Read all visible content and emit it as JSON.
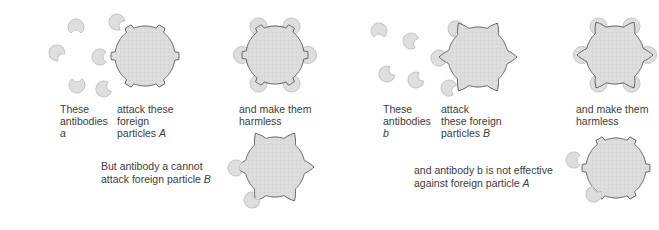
{
  "colors": {
    "background": "#ffffff",
    "particle_fill": "#dcdcdc",
    "particle_stroke": "#555555",
    "antibody_fill": "#dedede",
    "antibody_stroke": "#c4c4c4",
    "text": "#3c3c3c"
  },
  "panels": {
    "left": {
      "antibody_label": [
        "These",
        "antibodies"
      ],
      "antibody_symbol": "a",
      "attack_label": [
        "attack these",
        "foreign",
        "particles"
      ],
      "attack_symbol": "A",
      "result_label": [
        "and make them",
        "harmless"
      ],
      "note": [
        "But antibody a cannot",
        "attack foreign particle"
      ],
      "note_symbol": "B",
      "free_antibodies": [
        {
          "x": 76,
          "y": 27,
          "rot": 90
        },
        {
          "x": 117,
          "y": 22,
          "rot": 30
        },
        {
          "x": 57,
          "y": 53,
          "rot": 45
        },
        {
          "x": 100,
          "y": 57,
          "rot": 0
        },
        {
          "x": 77,
          "y": 85,
          "rot": -90
        },
        {
          "x": 104,
          "y": 89,
          "rot": -20
        }
      ],
      "target_particle": {
        "type": "A",
        "x": 145,
        "y": 56,
        "r": 30
      },
      "bound_particle": {
        "type": "A",
        "x": 275,
        "y": 55,
        "r": 29
      },
      "nontarget_particle": {
        "type": "B",
        "x": 275,
        "y": 167,
        "r": 30
      },
      "nontarget_antibodies": [
        {
          "x": 236,
          "y": 168,
          "rot": 0
        },
        {
          "x": 252,
          "y": 200,
          "rot": -45
        }
      ]
    },
    "right": {
      "antibody_label": [
        "These",
        "antibodies"
      ],
      "antibody_symbol": "b",
      "attack_label": [
        "attack",
        "these foreign",
        "particles"
      ],
      "attack_symbol": "B",
      "result_label": [
        "and make them",
        "harmless"
      ],
      "note": [
        "and antibody b is not effective",
        "against foreign particle"
      ],
      "note_symbol": "A",
      "free_antibodies": [
        {
          "x": 379,
          "y": 31,
          "rot": 90
        },
        {
          "x": 411,
          "y": 41,
          "rot": 20
        },
        {
          "x": 387,
          "y": 74,
          "rot": -30
        },
        {
          "x": 416,
          "y": 80,
          "rot": -30
        },
        {
          "x": 439,
          "y": 58,
          "rot": 0
        },
        {
          "x": 456,
          "y": 29,
          "rot": 60
        },
        {
          "x": 449,
          "y": 88,
          "rot": 20
        }
      ],
      "target_particle": {
        "type": "B",
        "x": 478,
        "y": 57,
        "r": 30
      },
      "bound_particle": {
        "type": "B",
        "x": 615,
        "y": 55,
        "r": 29
      },
      "nontarget_particle": {
        "type": "A",
        "x": 616,
        "y": 168,
        "r": 30
      },
      "nontarget_antibodies": [
        {
          "x": 574,
          "y": 160,
          "rot": 0
        },
        {
          "x": 594,
          "y": 194,
          "rot": -60
        }
      ]
    }
  }
}
